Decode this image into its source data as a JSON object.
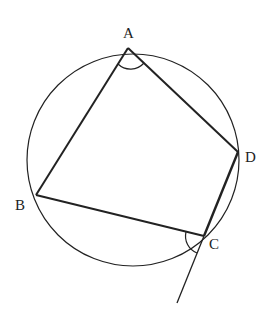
{
  "diagram": {
    "type": "cyclic-quadrilateral",
    "labels": {
      "A": "A",
      "B": "B",
      "C": "C",
      "D": "D"
    },
    "colors": {
      "stroke": "#222222",
      "background": "#ffffff"
    }
  }
}
